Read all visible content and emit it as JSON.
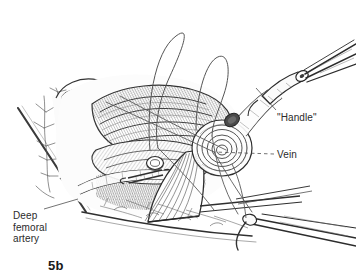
{
  "figure": {
    "caption": "5b",
    "type": "medical-surgical-illustration",
    "medium": "pen-and-ink line drawing with cross-hatching",
    "background_color": "#ffffff",
    "ink_color": "#333333"
  },
  "labels": {
    "handle": "\"Handle\"",
    "vein": "Vein",
    "deep_femoral_artery": "Deep\nfemoral\nartery"
  },
  "leaders": {
    "handle": {
      "style": "solid",
      "from_x": 276,
      "from_y": 110,
      "to_x": 256,
      "to_y": 88
    },
    "vein": {
      "style": "dashed",
      "from_x": 274,
      "from_y": 154,
      "to_x": 214,
      "to_y": 152
    },
    "deep_femoral_artery": {
      "style": "solid",
      "from_x": 44,
      "from_y": 209,
      "to_x": 78,
      "to_y": 199
    }
  },
  "scene_elements": [
    {
      "name": "suture-loop-large-left",
      "description": "Large looping suture thread arcing above the wound"
    },
    {
      "name": "suture-loop-right",
      "description": "Second suture loop to the right"
    },
    {
      "name": "forceps-upper-right",
      "description": "Forceps instrument gripping the vein end, the \"Handle\""
    },
    {
      "name": "vein-coil",
      "description": "Cut end of vein shown as concentric spiral coil"
    },
    {
      "name": "retractor-blade",
      "description": "Fan-shaped retractor blade with radiating striations"
    },
    {
      "name": "muscle-belly",
      "description": "Hatched muscle bellies in the wound bed"
    },
    {
      "name": "fat-lobules",
      "description": "Subcutaneous fat lobules along the upper-left wound margin"
    },
    {
      "name": "skin-edge-left",
      "description": "Long diagonal skin incision edge at the left"
    },
    {
      "name": "skin-edge-lower",
      "description": "Lower skin and fascia margin sweeping to the lower right"
    },
    {
      "name": "needle-holder-lower-right",
      "description": "Needle holder clamping a curved suture needle"
    },
    {
      "name": "deep-femoral-artery-vessel",
      "description": "Deep femoral artery within the wound bed"
    }
  ]
}
